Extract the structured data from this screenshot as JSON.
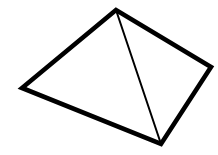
{
  "figure": {
    "name": "pyramid-line-drawing",
    "background_color": "#ffffff",
    "stroke_color": "#000000",
    "canvas": {
      "width": 218,
      "height": 155
    },
    "vertices": {
      "apex": {
        "label": "apex",
        "x": 116,
        "y": 10
      },
      "left": {
        "label": "left corner",
        "x": 22,
        "y": 88
      },
      "bottom": {
        "label": "front corner",
        "x": 161,
        "y": 144
      },
      "right": {
        "label": "right corner",
        "x": 211,
        "y": 67
      }
    },
    "outline": {
      "name": "pyramid-outline",
      "points": "116,10 22,88 161,144 211,67",
      "stroke_width": 4.6,
      "fill": "none"
    },
    "interior_edge": {
      "name": "pyramid-interior-edge",
      "from": "apex",
      "to": "bottom",
      "x1": 116,
      "y1": 10,
      "x2": 161,
      "y2": 144,
      "stroke_width": 2.0
    },
    "faces": [
      {
        "name": "left-face",
        "points": "116,10 22,88 161,144"
      },
      {
        "name": "right-face",
        "points": "116,10 161,144 211,67"
      }
    ]
  }
}
